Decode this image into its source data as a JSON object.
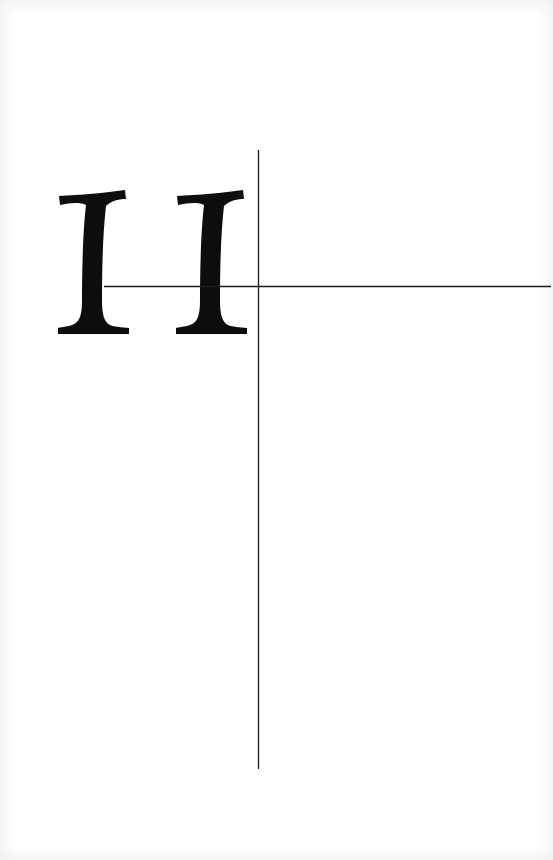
{
  "page": {
    "type": "chapter-opener",
    "chapter_numeral": "II",
    "ink_color": "#0d0d0d",
    "rule_color": "#1a1a1a",
    "background": "#ffffff"
  },
  "rules": {
    "vertical": {
      "x": 258.5,
      "y_start": 150,
      "y_end": 769
    },
    "horizontal": {
      "y": 286.5,
      "x_start": 104,
      "x_end": 551
    }
  }
}
